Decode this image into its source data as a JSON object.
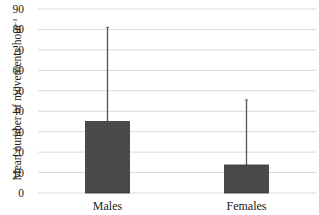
{
  "chart_data": {
    "type": "bar",
    "title": "",
    "xlabel": "",
    "ylabel": "Mean number of movements hour",
    "ylabel_superscript": "-1",
    "categories": [
      "Males",
      "Females"
    ],
    "values": [
      35,
      13.7
    ],
    "error_upper": [
      81,
      45.5
    ],
    "ylim": [
      0,
      90
    ],
    "yticks": [
      0,
      10,
      20,
      30,
      40,
      50,
      60,
      70,
      80,
      90
    ],
    "grid": true,
    "legend": null,
    "bar_color": "#4a4a4a",
    "error_bar_color": "#555555",
    "grid_color": "#d9d9d9"
  }
}
